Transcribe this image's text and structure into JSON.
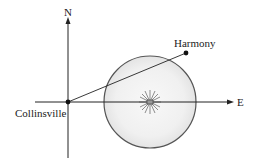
{
  "diagram": {
    "axes": {
      "north_label": "N",
      "east_label": "E"
    },
    "points": {
      "origin_label": "Collinsville",
      "target_label": "Harmony"
    },
    "colors": {
      "line": "#222222",
      "circle_stroke": "#555555",
      "circle_fill_center": "#f7f7f7",
      "circle_fill_edge": "#e6e6e6"
    }
  }
}
